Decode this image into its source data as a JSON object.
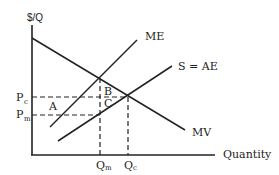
{
  "diagram": {
    "type": "economics-monopsony-diagram",
    "axes": {
      "y_label": "$/Q",
      "x_label": "Quantity"
    },
    "curves": [
      {
        "id": "mv",
        "label": "MV",
        "description": "marginal value (demand)",
        "slope": "downward"
      },
      {
        "id": "me",
        "label": "ME",
        "description": "marginal expenditure",
        "slope": "upward"
      },
      {
        "id": "s_ae",
        "label": "S = AE",
        "description": "supply = average expenditure",
        "slope": "upward"
      }
    ],
    "price_levels": {
      "pc": {
        "main": "P",
        "sub": "c"
      },
      "pm": {
        "main": "P",
        "sub": "m"
      }
    },
    "quantity_levels": {
      "qm": {
        "main": "Q",
        "sub": "m"
      },
      "qc": {
        "main": "Q",
        "sub": "c"
      }
    },
    "areas": {
      "a": "A",
      "b": "B",
      "c": "C"
    }
  }
}
